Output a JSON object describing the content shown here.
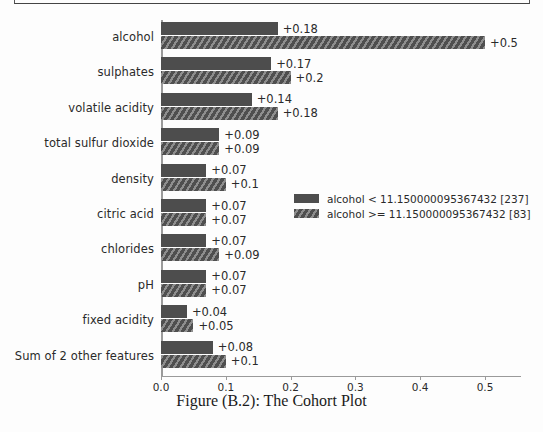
{
  "figure": {
    "caption": "Figure (B.2): The Cohort Plot"
  },
  "chart_data": {
    "type": "bar",
    "orientation": "horizontal",
    "title": "",
    "xlabel": "",
    "ylabel": "",
    "xlim": [
      0.0,
      0.556
    ],
    "grid": false,
    "legend_position": "center-right",
    "categories": [
      "alcohol",
      "sulphates",
      "volatile acidity",
      "total sulfur dioxide",
      "density",
      "citric acid",
      "chlorides",
      "pH",
      "fixed acidity",
      "Sum of 2 other features"
    ],
    "xticks": [
      "0.0",
      "0.1",
      "0.2",
      "0.3",
      "0.4",
      "0.5"
    ],
    "xtick_values": [
      0.0,
      0.1,
      0.2,
      0.3,
      0.4,
      0.5
    ],
    "series": [
      {
        "name": "alcohol < 11.150000095367432 [237]",
        "style": "solid",
        "color": "#4d4d4d",
        "values": [
          0.18,
          0.17,
          0.14,
          0.09,
          0.07,
          0.07,
          0.07,
          0.07,
          0.04,
          0.08
        ],
        "labels": [
          "+0.18",
          "+0.17",
          "+0.14",
          "+0.09",
          "+0.07",
          "+0.07",
          "+0.07",
          "+0.07",
          "+0.04",
          "+0.08"
        ]
      },
      {
        "name": "alcohol >= 11.150000095367432 [83]",
        "style": "hatched",
        "color": "#4f4f4f",
        "values": [
          0.5,
          0.2,
          0.18,
          0.09,
          0.1,
          0.07,
          0.09,
          0.07,
          0.05,
          0.1
        ],
        "labels": [
          "+0.5",
          "+0.2",
          "+0.18",
          "+0.09",
          "+0.1",
          "+0.07",
          "+0.09",
          "+0.07",
          "+0.05",
          "+0.1"
        ]
      }
    ]
  },
  "legend": {
    "items": [
      {
        "label": "alcohol < 11.150000095367432 [237]",
        "style": "solid"
      },
      {
        "label": "alcohol >= 11.150000095367432 [83]",
        "style": "hatched"
      }
    ]
  }
}
